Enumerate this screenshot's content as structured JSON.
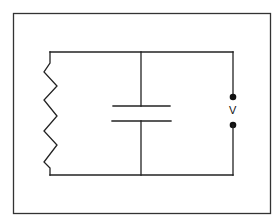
{
  "diagram": {
    "type": "circuit",
    "colors": {
      "line": "#222222",
      "background": "#ffffff"
    },
    "components": [
      {
        "kind": "resistor",
        "position": "left branch"
      },
      {
        "kind": "capacitor",
        "position": "middle branch"
      },
      {
        "kind": "voltage-terminals",
        "position": "right branch",
        "label": "V"
      }
    ],
    "terminal_label": "V"
  }
}
